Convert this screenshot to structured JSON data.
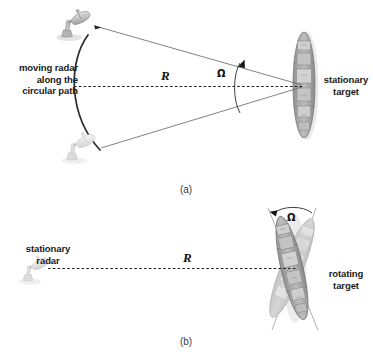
{
  "figure": {
    "background": "#ffffff",
    "ink": "#1a1a1a"
  },
  "panel_a": {
    "caption": "(a)",
    "radar_label": "moving radar\nalong the\ncircular path",
    "target_label": "stationary\ntarget",
    "range_symbol": "R",
    "angle_symbol": "Ω",
    "icons": {
      "radar_top": "radar-dish-icon",
      "radar_bottom": "radar-dish-icon",
      "target": "ship-icon",
      "angle_arrow": "arrowhead-icon",
      "beam_arrow": "arrowhead-icon"
    }
  },
  "panel_b": {
    "caption": "(b)",
    "radar_label": "stationary\nradar",
    "target_label": "rotating\ntarget",
    "range_symbol": "R",
    "angle_symbol": "Ω",
    "icons": {
      "radar": "radar-dish-icon",
      "target_primary": "ship-icon",
      "target_rotated": "ship-icon",
      "angle_arrow": "arrowhead-icon"
    }
  }
}
